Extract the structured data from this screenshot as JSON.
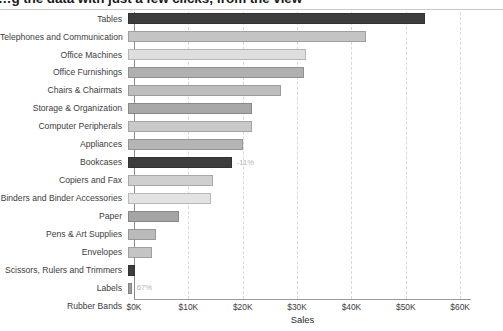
{
  "headline": {
    "text": "…g the data with just a few clicks, from the view"
  },
  "chart_data": {
    "type": "bar",
    "orientation": "horizontal",
    "title": "",
    "subtitle": "",
    "xlabel": "Sales",
    "ylabel": "",
    "xlim": [
      0,
      62000
    ],
    "xticks": [
      0,
      10000,
      20000,
      30000,
      40000,
      50000,
      60000
    ],
    "xticklabels": [
      "$0K",
      "$10K",
      "$20K",
      "$30K",
      "$40K",
      "$50K",
      "$60K"
    ],
    "grid": "vertical-dashed",
    "legend": "none",
    "categories": [
      "Tables",
      "Telephones and Communication",
      "Office Machines",
      "Office Furnishings",
      "Chairs & Chairmats",
      "Storage & Organization",
      "Computer Peripherals",
      "Appliances",
      "Bookcases",
      "Copiers and Fax",
      "Binders and Binder Accessories",
      "Paper",
      "Pens & Art Supplies",
      "Envelopes",
      "Scissors, Rulers and Trimmers",
      "Labels",
      "Rubber Bands"
    ],
    "values": [
      54700,
      43800,
      32800,
      32300,
      28200,
      22900,
      22800,
      21200,
      19100,
      15600,
      15200,
      9300,
      5200,
      4400,
      1200,
      700,
      0
    ],
    "bar_colors": [
      "#3d3d3d",
      "#c4c4c4",
      "#dedede",
      "#b0b0b0",
      "#bdbdbd",
      "#a8a8a8",
      "#c9c9c9",
      "#b5b5b5",
      "#3d3d3d",
      "#cfcfcf",
      "#e2e2e2",
      "#a5a5a5",
      "#bababa",
      "#c4c4c4",
      "#3d3d3d",
      "#9e9e9e",
      "#cccccc"
    ],
    "annotations": [
      {
        "category": "Bookcases",
        "label": "-11%"
      },
      {
        "category": "Labels",
        "label": "67%"
      }
    ]
  }
}
